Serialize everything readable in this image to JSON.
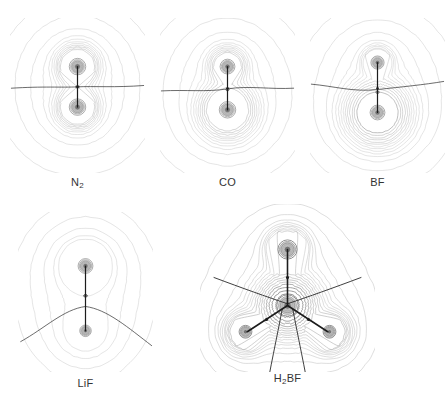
{
  "figure": {
    "kind": "electron-density-contour-maps",
    "background_color": "#ffffff",
    "width": 448,
    "height": 407,
    "contour_color_outer": "#b9b9b9",
    "contour_color_mid": "#9a9a9a",
    "contour_color_inner": "#6d6d6d",
    "nucleus_color": "#8e8e8e",
    "bond_path_color": "#1c1c1c",
    "zero_flux_color": "#2d2d2d",
    "label_color": "#333333"
  },
  "panels": [
    {
      "id": "n2",
      "label": "N",
      "label_sub": "2",
      "label_full": "N2",
      "type": "diatomic-homonuclear",
      "x": 10,
      "y": 18,
      "w": 135,
      "h": 155,
      "label_x": 10,
      "label_y": 176,
      "label_w": 135,
      "atoms": [
        {
          "symbol": "N",
          "cx": 50,
          "cy": 36,
          "r": 11,
          "core_r": 5
        },
        {
          "symbol": "N",
          "cx": 50,
          "cy": 66,
          "r": 11,
          "core_r": 5
        }
      ],
      "bond_paths": [
        {
          "x1": 50,
          "y1": 36,
          "x2": 50,
          "y2": 66
        }
      ],
      "bond_critical_points": [
        {
          "cx": 50,
          "cy": 51
        }
      ],
      "zero_flux_surfaces": [
        {
          "d": "M 1 52 C 25 50.5 38 51.6 50 51 C 62 50.4 78 51.6 99 50",
          "kind": "horizontal-straight"
        }
      ],
      "envelope": {
        "rx": 42,
        "ry": 62,
        "cx": 50,
        "cy": 51,
        "waist": 0.0,
        "shape": "oval"
      },
      "inner_shape": "figure-eight-symmetric",
      "n_contours": 16
    },
    {
      "id": "co",
      "label": "CO",
      "label_sub": "",
      "label_full": "CO",
      "type": "diatomic-heteronuclear",
      "x": 160,
      "y": 18,
      "w": 135,
      "h": 155,
      "label_x": 160,
      "label_y": 176,
      "label_w": 135,
      "atoms": [
        {
          "symbol": "C",
          "cx": 50,
          "cy": 36,
          "r": 10,
          "core_r": 4.5
        },
        {
          "symbol": "O",
          "cx": 50,
          "cy": 68,
          "r": 15,
          "core_r": 5
        }
      ],
      "bond_paths": [
        {
          "x1": 50,
          "y1": 36,
          "x2": 50,
          "y2": 68
        }
      ],
      "bond_critical_points": [
        {
          "cx": 50,
          "cy": 52
        }
      ],
      "zero_flux_surfaces": [
        {
          "d": "M 1 54 C 20 53 34 55 50 52.5 C 66 50 82 53 99 52",
          "kind": "slightly-curved"
        }
      ],
      "envelope": {
        "rx": 44,
        "ry": 63,
        "cx": 50,
        "cy": 53,
        "waist": 0.0,
        "shape": "oval-pear"
      },
      "inner_shape": "figure-eight-asymmetric-large-lower",
      "n_contours": 16
    },
    {
      "id": "bf",
      "label": "BF",
      "label_sub": "",
      "label_full": "BF",
      "type": "diatomic-polar",
      "x": 310,
      "y": 18,
      "w": 135,
      "h": 155,
      "label_x": 310,
      "label_y": 176,
      "label_w": 135,
      "atoms": [
        {
          "symbol": "B",
          "cx": 50,
          "cy": 33,
          "r": 8,
          "core_r": 4
        },
        {
          "symbol": "F",
          "cx": 50,
          "cy": 70,
          "r": 17,
          "core_r": 4.5
        }
      ],
      "bond_paths": [
        {
          "x1": 50,
          "y1": 33,
          "x2": 50,
          "y2": 70
        }
      ],
      "bond_critical_points": [
        {
          "cx": 50,
          "cy": 52
        }
      ],
      "zero_flux_surfaces": [
        {
          "d": "M 1 49 C 18 50.5 32 55 50 53 C 68 51 84 49.5 99 47",
          "kind": "curved-near-boron"
        }
      ],
      "envelope": {
        "rx": 45,
        "ry": 63,
        "cx": 50,
        "cy": 55,
        "waist": 0.0,
        "shape": "oval"
      },
      "inner_shape": "crescent-horseshoe-around-fluorine",
      "n_contours": 17
    },
    {
      "id": "lif",
      "label": "LiF",
      "label_sub": "",
      "label_full": "LiF",
      "type": "diatomic-ionic",
      "x": 18,
      "y": 212,
      "w": 135,
      "h": 160,
      "label_x": 18,
      "label_y": 377,
      "label_w": 135,
      "atoms": [
        {
          "symbol": "Li",
          "cx": 50,
          "cy": 40,
          "r": 10,
          "core_r": 4.5
        },
        {
          "symbol": "F",
          "cx": 50,
          "cy": 88,
          "r": 6,
          "core_r": 3.5
        }
      ],
      "bond_paths": [
        {
          "x1": 50,
          "y1": 40,
          "x2": 50,
          "y2": 88
        }
      ],
      "bond_critical_points": [],
      "zero_flux_surfaces": [
        {
          "d": "M 2 96 C 20 86 34 72 50 70 C 66 72 82 86 99 99",
          "kind": "strongly-curved-arc"
        }
      ],
      "envelope": {
        "rx": 45,
        "ry": 66,
        "cx": 50,
        "cy": 62,
        "waist": 0.0,
        "shape": "pear-egg"
      },
      "inner_shape": "two-separate-spherical-ion-sets",
      "n_contours": 18
    },
    {
      "id": "h2bf",
      "label": "H",
      "label_sub": "2",
      "label_suffix": "BF",
      "label_full": "H2BF",
      "type": "polyatomic-planar",
      "x": 200,
      "y": 204,
      "w": 175,
      "h": 168,
      "label_x": 200,
      "label_y": 372,
      "label_w": 175,
      "atoms": [
        {
          "symbol": "F",
          "cx": 50,
          "cy": 26,
          "r": 9,
          "core_r": 4.5
        },
        {
          "symbol": "B",
          "cx": 50,
          "cy": 58,
          "r": 14,
          "core_r": 5
        },
        {
          "symbol": "H",
          "cx": 26,
          "cy": 73,
          "r": 9,
          "core_r": 3
        },
        {
          "symbol": "H",
          "cx": 74,
          "cy": 73,
          "r": 9,
          "core_r": 3
        }
      ],
      "bond_paths": [
        {
          "x1": 50,
          "y1": 26,
          "x2": 50,
          "y2": 58
        },
        {
          "x1": 50,
          "y1": 58,
          "x2": 27,
          "y2": 73
        },
        {
          "x1": 50,
          "y1": 58,
          "x2": 73,
          "y2": 73
        }
      ],
      "bond_critical_points": [
        {
          "cx": 50,
          "cy": 42
        },
        {
          "cx": 38,
          "cy": 66
        },
        {
          "cx": 62,
          "cy": 66
        }
      ],
      "zero_flux_surfaces": [
        {
          "d": "M 8 42 C 24 48 38 53 50 57",
          "kind": "radiating-upper-left"
        },
        {
          "d": "M 92 42 C 76 48 62 53 50 57",
          "kind": "radiating-upper-right"
        },
        {
          "d": "M 47 60 C 44 76 40 94 37 112",
          "kind": "radiating-lower-left"
        },
        {
          "d": "M 53 60 C 56 76 60 94 63 112",
          "kind": "radiating-lower-right"
        }
      ],
      "envelope": {
        "rx": 48,
        "ry": 60,
        "cx": 50,
        "cy": 62,
        "waist": 0.0,
        "shape": "rounded-triangle"
      },
      "inner_shape": "trigonal-boron-with-two-hydrogen-lobes",
      "n_contours": 17
    }
  ]
}
